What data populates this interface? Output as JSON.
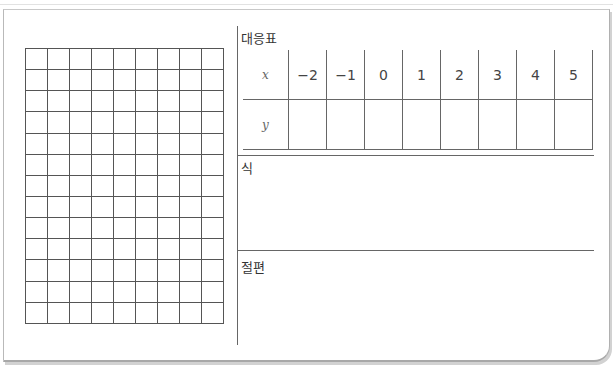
{
  "grid": {
    "columns": 9,
    "rows": 13
  },
  "table_section": {
    "title": "대응표",
    "x_header": "x",
    "y_header": "y",
    "x_values": [
      "−2",
      "−1",
      "0",
      "1",
      "2",
      "3",
      "4",
      "5"
    ],
    "y_values": [
      "",
      "",
      "",
      "",
      "",
      "",
      "",
      ""
    ]
  },
  "equation_section": {
    "title": "식",
    "value": ""
  },
  "intercept_section": {
    "title": "절편",
    "value": ""
  }
}
